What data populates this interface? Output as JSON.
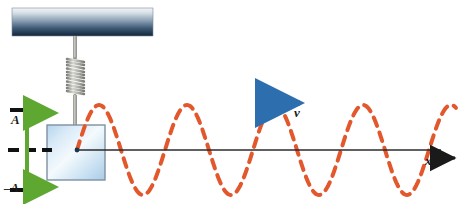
{
  "figure": {
    "width": 459,
    "height": 204,
    "background": "#ffffff"
  },
  "labels": {
    "amplitude_positive": "A",
    "amplitude_negative": "–A",
    "velocity": "v",
    "axis_x": "x"
  },
  "colors": {
    "ceiling_top": "#eef1f4",
    "ceiling_bottom": "#16293f",
    "spring_metal": "#9a9a96",
    "block_fill_light": "#eaf3fb",
    "block_fill_mid": "#bcd8ee",
    "block_stroke": "#6e7f93",
    "wave": "#e2582c",
    "axis": "#2b2b2b",
    "amplitude_arrow": "#5ea832",
    "velocity_arrow": "#2d6fae",
    "tick": "#111111",
    "dashed_center": "#111111"
  },
  "elements": {
    "ceiling": {
      "name": "ceiling-support-bar",
      "x": 12,
      "y": 8,
      "width": 141,
      "height": 28
    },
    "rod_upper": {
      "name": "hanger-rod",
      "x": 75,
      "y_top": 36,
      "y_bottom": 58
    },
    "spring": {
      "name": "coil-spring",
      "cx": 75,
      "y_top": 57,
      "y_bottom": 96,
      "coils": 11,
      "width": 17
    },
    "rod_lower": {
      "name": "spring-to-block-rod",
      "x": 75,
      "y_top": 96,
      "y_bottom": 126
    },
    "block": {
      "name": "oscillating-block",
      "x": 47,
      "y": 125,
      "width": 58,
      "height": 55
    },
    "equilibrium_line": {
      "name": "equilibrium-axis",
      "x1": 77,
      "y": 150,
      "x2": 442
    },
    "tick_top": {
      "name": "amplitude-tick-top",
      "x1": 10,
      "x2": 48,
      "y": 110
    },
    "tick_bottom": {
      "name": "amplitude-tick-bottom",
      "x1": 10,
      "x2": 48,
      "y": 190
    },
    "dashed_equilibrium_left": {
      "name": "equilibrium-dashed-marker",
      "x1": 8,
      "x2": 50,
      "y": 150
    },
    "amplitude_arrow": {
      "name": "amplitude-double-arrow",
      "x": 27,
      "y_top": 110,
      "y_bottom": 190
    },
    "velocity_arrow": {
      "name": "velocity-arrow",
      "x1": 266,
      "x2": 303,
      "y": 103
    },
    "x_axis_arrow": {
      "name": "x-axis-arrow",
      "x1": 440,
      "x2": 456,
      "y": 158
    }
  },
  "chart_data": {
    "type": "line",
    "xlabel": "x",
    "ylabel": "",
    "amplitude_label_top": "A",
    "amplitude_label_bottom": "–A",
    "equilibrium_y": 150,
    "amplitude_px": 45,
    "period_px": 88,
    "phase": "starts at equilibrium rising",
    "x_start": 77,
    "x_end": 456,
    "stroke_color": "#e2582c",
    "stroke_dash": "9 7",
    "stroke_width": 4,
    "cycles": 4.3,
    "samples_hint": "y(x) = 150 - 45*sin(2*pi*(x-77)/88)"
  }
}
